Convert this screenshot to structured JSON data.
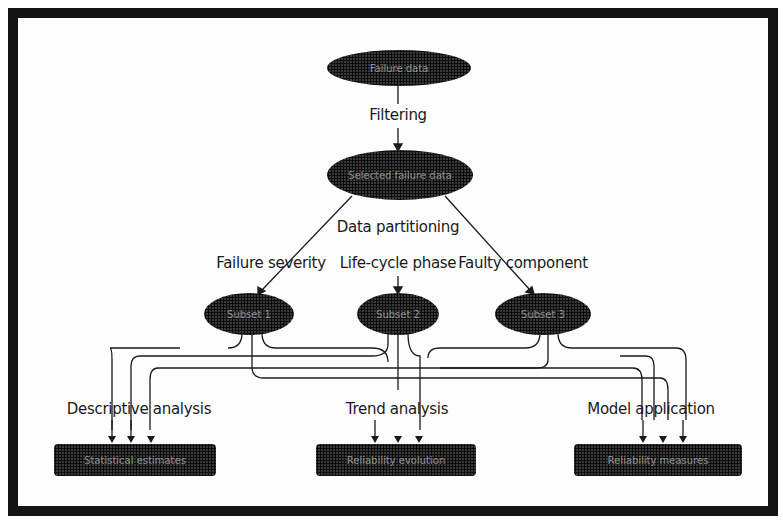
{
  "diagram": {
    "top_node": {
      "label": "Failure data"
    },
    "step_filtering": {
      "label": "Filtering"
    },
    "filtered_node": {
      "label": "Selected failure data"
    },
    "step_partitioning": {
      "label": "Data partitioning"
    },
    "partition_criteria": [
      {
        "label": "Failure severity"
      },
      {
        "label": "Life-cycle phase"
      },
      {
        "label": "Faulty component"
      }
    ],
    "subset_nodes": [
      {
        "label": "Subset 1"
      },
      {
        "label": "Subset 2"
      },
      {
        "label": "Subset 3"
      }
    ],
    "analyses": [
      {
        "label": "Descriptive analysis",
        "result": "Statistical estimates"
      },
      {
        "label": "Trend analysis",
        "result": "Reliability evolution"
      },
      {
        "label": "Model application",
        "result": "Reliability measures"
      }
    ],
    "colors": {
      "frame": "#141414",
      "node_fill": "#1e1e1e",
      "line": "#1a1a1a",
      "background": "#fdfdfd"
    }
  }
}
